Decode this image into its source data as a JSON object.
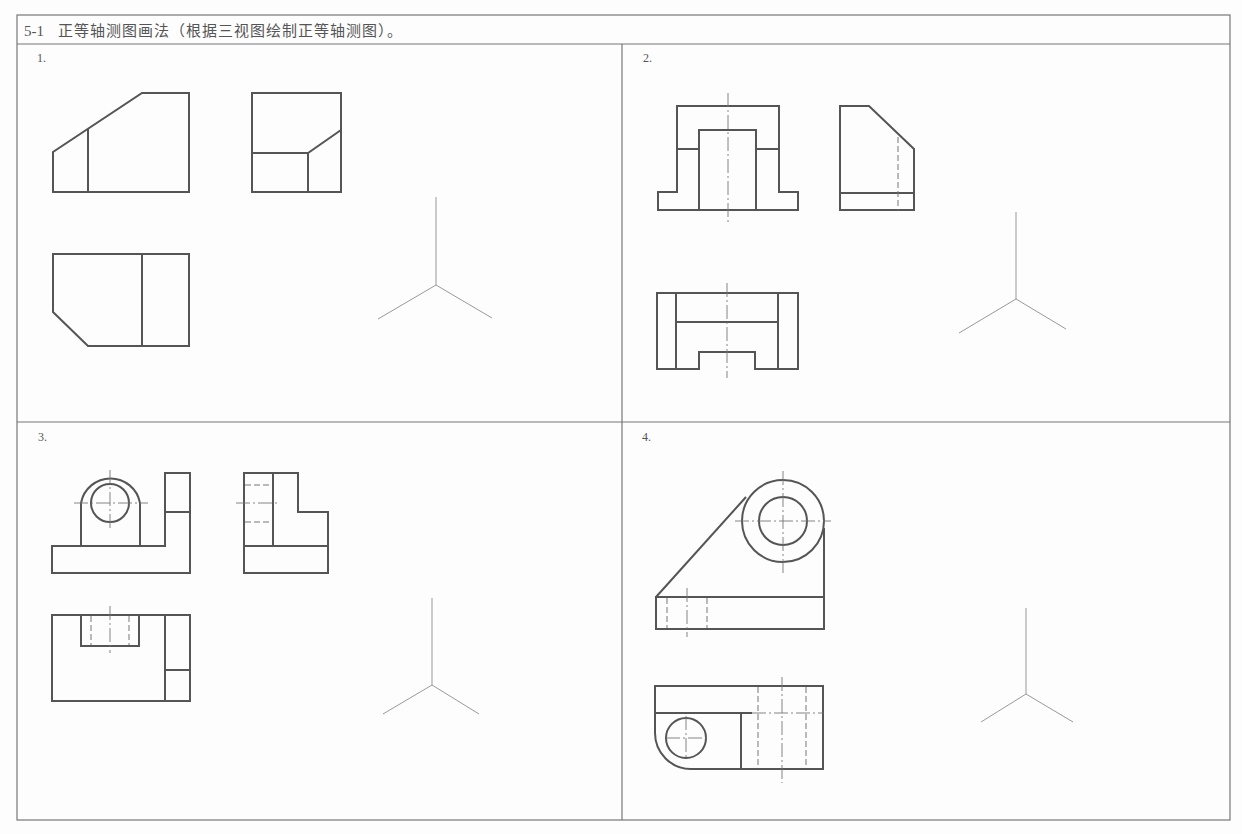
{
  "header": {
    "exercise_number": "5-1",
    "title": "正等轴测图画法（根据三视图绘制正等轴测图）。"
  },
  "problems": [
    {
      "label": "1.",
      "views": [
        "front-view",
        "side-view",
        "top-view"
      ],
      "has_isometric_axes": true
    },
    {
      "label": "2.",
      "views": [
        "front-view",
        "side-view",
        "top-view"
      ],
      "has_isometric_axes": true
    },
    {
      "label": "3.",
      "views": [
        "front-view",
        "side-view",
        "top-view"
      ],
      "has_isometric_axes": true
    },
    {
      "label": "4.",
      "views": [
        "front-view",
        "top-view"
      ],
      "has_isometric_axes": true
    }
  ],
  "colors": {
    "object_line": "#555555",
    "frame_line": "#777777",
    "axis_line": "#999999",
    "background": "#fdfdfd"
  }
}
